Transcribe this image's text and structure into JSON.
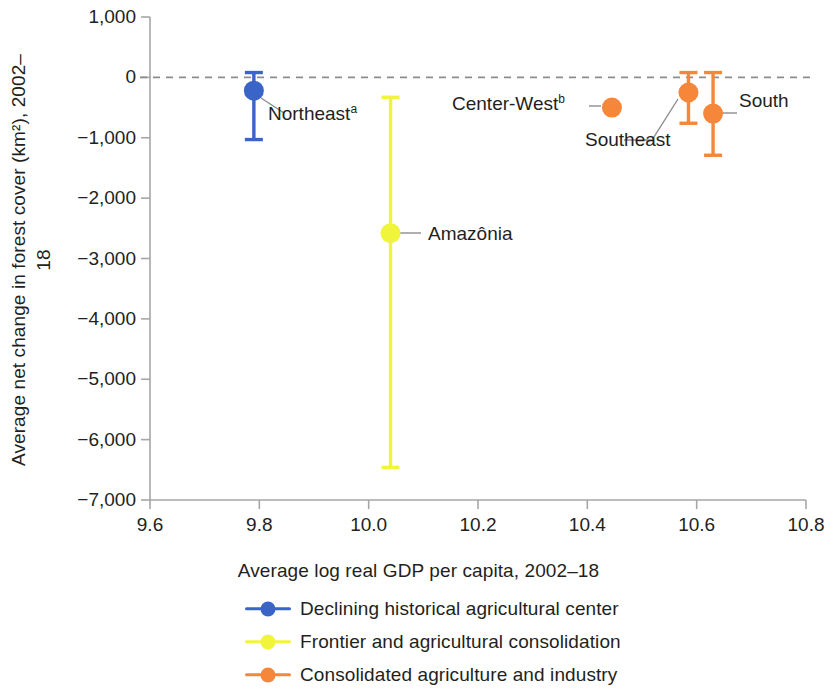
{
  "chart_data": {
    "type": "scatter",
    "title": "",
    "xlabel": "Average log real GDP per capita, 2002–18",
    "ylabel": "Average net change in forest cover (km²), 2002–18",
    "xlim": [
      9.6,
      10.8
    ],
    "ylim": [
      -7000,
      1000
    ],
    "xticks": [
      "9.6",
      "9.8",
      "10.0",
      "10.2",
      "10.4",
      "10.6",
      "10.8"
    ],
    "xtick_values": [
      9.6,
      9.8,
      10.0,
      10.2,
      10.4,
      10.6,
      10.8
    ],
    "yticks": [
      "1,000",
      "0",
      "−1,000",
      "−2,000",
      "−3,000",
      "−4,000",
      "−5,000",
      "−6,000",
      "−7,000"
    ],
    "ytick_values": [
      1000,
      0,
      -1000,
      -2000,
      -3000,
      -4000,
      -5000,
      -6000,
      -7000
    ],
    "grid": false,
    "zero_reference_line": 0,
    "legend_position": "bottom",
    "points": [
      {
        "label": "Northeast",
        "footnote": "a",
        "x": 9.79,
        "y": -220,
        "y_low": -1030,
        "y_high": 80,
        "series": "Declining historical agricultural center",
        "color": "#3a64c8",
        "has_error_bar": true
      },
      {
        "label": "Amazônia",
        "footnote": "",
        "x": 10.04,
        "y": -2580,
        "y_low": -6460,
        "y_high": -330,
        "series": "Frontier and agricultural consolidation",
        "color": "#f0f53c",
        "has_error_bar": true
      },
      {
        "label": "Center-West",
        "footnote": "b",
        "x": 10.445,
        "y": -500,
        "y_low": -500,
        "y_high": -500,
        "series": "Consolidated agriculture and industry",
        "color": "#f5863a",
        "has_error_bar": false
      },
      {
        "label": "Southeast",
        "footnote": "",
        "x": 10.585,
        "y": -250,
        "y_low": -760,
        "y_high": 80,
        "series": "Consolidated agriculture and industry",
        "color": "#f5863a",
        "has_error_bar": true
      },
      {
        "label": "South",
        "footnote": "",
        "x": 10.63,
        "y": -600,
        "y_low": -1290,
        "y_high": 80,
        "series": "Consolidated agriculture and industry",
        "color": "#f5863a",
        "has_error_bar": true
      }
    ],
    "series": [
      {
        "name": "Declining historical agricultural center",
        "color": "#3a64c8",
        "categories": [
          "Northeast"
        ],
        "values": [
          -220
        ]
      },
      {
        "name": "Frontier and agricultural consolidation",
        "color": "#f0f53c",
        "categories": [
          "Amazônia"
        ],
        "values": [
          -2580
        ]
      },
      {
        "name": "Consolidated agriculture and industry",
        "color": "#f5863a",
        "categories": [
          "Center-West",
          "Southeast",
          "South"
        ],
        "values": [
          -500,
          -250,
          -600
        ]
      }
    ]
  },
  "axes": {
    "y_title": "Average net change in forest cover (km²), 2002–18",
    "x_title": "Average log real GDP per capita, 2002–18"
  },
  "legend": {
    "items": [
      {
        "label": "Declining historical agricultural center",
        "color": "#3a64c8"
      },
      {
        "label": "Frontier and agricultural consolidation",
        "color": "#f0f53c"
      },
      {
        "label": "Consolidated agriculture and industry",
        "color": "#f5863a"
      }
    ]
  },
  "annotations": {
    "northeast": "Northeast",
    "northeast_footnote": "a",
    "amazonia": "Amazônia",
    "center_west": "Center-West",
    "center_west_footnote": "b",
    "southeast": "Southeast",
    "south": "South"
  }
}
